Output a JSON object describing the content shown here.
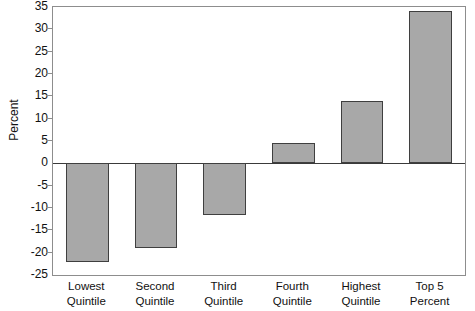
{
  "chart_data": {
    "type": "bar",
    "title": "",
    "subtitle": "",
    "xlabel": "",
    "ylabel": "Percent",
    "categories": [
      "Lowest Quintile",
      "Second Quintile",
      "Third Quintile",
      "Fourth Quintile",
      "Highest Quintile",
      "Top 5 Percent"
    ],
    "category_lines": [
      [
        "Lowest",
        "Quintile"
      ],
      [
        "Second",
        "Quintile"
      ],
      [
        "Third",
        "Quintile"
      ],
      [
        "Fourth",
        "Quintile"
      ],
      [
        "Highest",
        "Quintile"
      ],
      [
        "Top 5",
        "Percent"
      ]
    ],
    "values": [
      -22,
      -19,
      -11.5,
      4.5,
      14,
      34
    ],
    "ylim": [
      -25,
      35
    ],
    "ytick_step": 5,
    "yticks": [
      35,
      30,
      25,
      20,
      15,
      10,
      5,
      0,
      -5,
      -10,
      -15,
      -20,
      -25
    ],
    "ytick_labels": [
      "35",
      "30",
      "25",
      "20",
      "15",
      "10",
      "5",
      "0",
      "-5",
      "-10",
      "-15",
      "-20",
      "-25"
    ],
    "grid": false,
    "legend": null,
    "legend_position": "none",
    "series": [
      {
        "name": "Percent change",
        "values": [
          -22,
          -19,
          -11.5,
          4.5,
          14,
          34
        ]
      }
    ],
    "colors": {
      "bar_fill": "#a8a8a8",
      "bar_border": "#3f3f3f",
      "axis": "#8d8d8d",
      "zero_line": "#3a3a3a",
      "text": "#111111",
      "background": "#ffffff"
    }
  }
}
